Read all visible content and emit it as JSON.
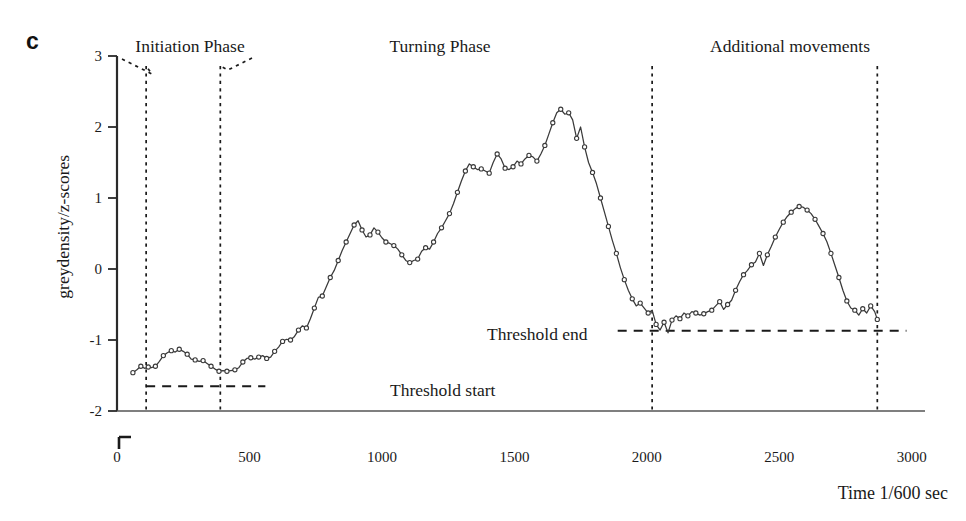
{
  "panel": {
    "label": "c"
  },
  "axes": {
    "y_title": "greydensity/z-scores",
    "x_title": "Time 1/600 sec",
    "y_ticks": [
      "3",
      "2",
      "1",
      "0",
      "-1",
      "-2"
    ],
    "x_ticks": [
      "0",
      "500",
      "1000",
      "1500",
      "2000",
      "2500",
      "3000"
    ]
  },
  "phases": [
    {
      "name": "initiation",
      "label": "Initiation Phase"
    },
    {
      "name": "turning",
      "label": "Turning Phase"
    },
    {
      "name": "additional",
      "label": "Additional movements"
    }
  ],
  "thresholds": [
    {
      "name": "threshold-start",
      "label": "Threshold start",
      "value": -1.65
    },
    {
      "name": "threshold-end",
      "label": "Threshold end",
      "value": -0.87
    }
  ],
  "chart_data": {
    "type": "line",
    "title": "",
    "xlabel": "Time 1/600 sec",
    "ylabel": "greydensity/z-scores",
    "xlim": [
      0,
      3050
    ],
    "ylim": [
      -2,
      3
    ],
    "grid": false,
    "legend": "none",
    "marker": "open-circle",
    "line_color": "#333333",
    "annotations": {
      "phase_boundaries_x": [
        110,
        390,
        2020,
        2870
      ],
      "threshold_start_y": -1.65,
      "threshold_end_y": -0.87,
      "threshold_start_span_x": [
        110,
        560
      ],
      "threshold_end_span_x": [
        1890,
        2980
      ]
    },
    "series": [
      {
        "name": "greydensity",
        "x": [
          60,
          75,
          90,
          105,
          118,
          130,
          145,
          160,
          175,
          190,
          205,
          220,
          235,
          250,
          265,
          280,
          295,
          310,
          325,
          340,
          355,
          370,
          385,
          400,
          415,
          430,
          445,
          460,
          475,
          490,
          505,
          520,
          535,
          550,
          565,
          580,
          595,
          610,
          625,
          640,
          655,
          670,
          685,
          700,
          715,
          730,
          745,
          760,
          775,
          790,
          805,
          820,
          835,
          850,
          865,
          880,
          895,
          910,
          925,
          940,
          955,
          970,
          985,
          1000,
          1015,
          1030,
          1045,
          1060,
          1075,
          1090,
          1105,
          1120,
          1135,
          1150,
          1165,
          1180,
          1195,
          1210,
          1225,
          1240,
          1255,
          1270,
          1285,
          1300,
          1315,
          1330,
          1345,
          1360,
          1375,
          1390,
          1405,
          1420,
          1435,
          1450,
          1465,
          1480,
          1495,
          1510,
          1525,
          1540,
          1555,
          1570,
          1585,
          1600,
          1615,
          1630,
          1645,
          1660,
          1675,
          1690,
          1705,
          1720,
          1735,
          1750,
          1765,
          1780,
          1795,
          1810,
          1825,
          1840,
          1855,
          1870,
          1885,
          1900,
          1915,
          1930,
          1945,
          1960,
          1975,
          1990,
          2005,
          2020,
          2035,
          2050,
          2065,
          2080,
          2095,
          2110,
          2125,
          2140,
          2155,
          2170,
          2185,
          2200,
          2215,
          2230,
          2245,
          2260,
          2275,
          2290,
          2305,
          2320,
          2335,
          2350,
          2365,
          2380,
          2395,
          2410,
          2425,
          2440,
          2455,
          2470,
          2485,
          2500,
          2515,
          2530,
          2545,
          2560,
          2575,
          2590,
          2605,
          2620,
          2635,
          2650,
          2665,
          2680,
          2695,
          2710,
          2725,
          2740,
          2755,
          2770,
          2785,
          2800,
          2815,
          2830,
          2845,
          2860,
          2870
        ],
        "y": [
          -1.46,
          -1.42,
          -1.37,
          -1.4,
          -1.38,
          -1.39,
          -1.37,
          -1.3,
          -1.22,
          -1.18,
          -1.15,
          -1.17,
          -1.13,
          -1.16,
          -1.2,
          -1.27,
          -1.28,
          -1.3,
          -1.29,
          -1.33,
          -1.37,
          -1.41,
          -1.44,
          -1.43,
          -1.44,
          -1.43,
          -1.42,
          -1.39,
          -1.31,
          -1.26,
          -1.25,
          -1.27,
          -1.24,
          -1.22,
          -1.26,
          -1.24,
          -1.16,
          -1.1,
          -1.02,
          -0.99,
          -1.0,
          -0.95,
          -0.86,
          -0.8,
          -0.83,
          -0.7,
          -0.55,
          -0.4,
          -0.38,
          -0.25,
          -0.12,
          -0.02,
          0.12,
          0.26,
          0.38,
          0.5,
          0.62,
          0.68,
          0.55,
          0.45,
          0.48,
          0.58,
          0.52,
          0.44,
          0.38,
          0.36,
          0.33,
          0.28,
          0.2,
          0.12,
          0.09,
          0.12,
          0.14,
          0.25,
          0.3,
          0.28,
          0.38,
          0.5,
          0.58,
          0.68,
          0.78,
          0.92,
          1.08,
          1.24,
          1.38,
          1.48,
          1.44,
          1.4,
          1.41,
          1.38,
          1.35,
          1.5,
          1.62,
          1.55,
          1.42,
          1.4,
          1.44,
          1.52,
          1.48,
          1.55,
          1.6,
          1.58,
          1.52,
          1.62,
          1.74,
          1.9,
          2.06,
          2.2,
          2.25,
          2.18,
          2.2,
          2.1,
          1.84,
          2.0,
          1.72,
          1.5,
          1.36,
          1.2,
          1.0,
          0.8,
          0.6,
          0.4,
          0.22,
          0.02,
          -0.15,
          -0.3,
          -0.42,
          -0.52,
          -0.48,
          -0.55,
          -0.62,
          -0.58,
          -0.78,
          -0.86,
          -0.75,
          -0.9,
          -0.72,
          -0.66,
          -0.7,
          -0.62,
          -0.66,
          -0.6,
          -0.62,
          -0.65,
          -0.63,
          -0.6,
          -0.58,
          -0.52,
          -0.46,
          -0.57,
          -0.5,
          -0.44,
          -0.3,
          -0.18,
          -0.08,
          -0.02,
          0.06,
          0.1,
          0.22,
          0.05,
          0.2,
          0.32,
          0.45,
          0.56,
          0.66,
          0.74,
          0.8,
          0.85,
          0.88,
          0.87,
          0.83,
          0.78,
          0.7,
          0.6,
          0.5,
          0.38,
          0.22,
          0.05,
          -0.12,
          -0.3,
          -0.45,
          -0.55,
          -0.58,
          -0.65,
          -0.56,
          -0.62,
          -0.52,
          -0.6,
          -0.71
        ]
      }
    ]
  }
}
